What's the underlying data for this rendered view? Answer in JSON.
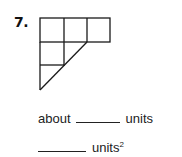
{
  "problem": {
    "number": "7.",
    "figure": {
      "description": "grid of unit squares with a diagonal cut forming a trapezoid-like shape",
      "stroke_color": "#1a1a1a",
      "cell_size_px": 23,
      "top_row_cells": 3,
      "second_row_cells": 2,
      "third_row_cells": 1
    },
    "perimeter_line": {
      "prefix": "about",
      "blank": "",
      "unit": "units"
    },
    "area_line": {
      "blank": "",
      "unit": "units",
      "exponent": "2"
    }
  }
}
